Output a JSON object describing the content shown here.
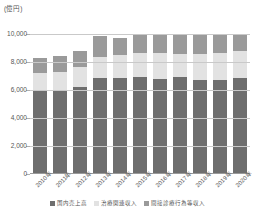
{
  "chart_data": {
    "type": "bar",
    "stacked": true,
    "title": "",
    "subtitle": "",
    "unit_label": "(億円)",
    "xlabel": "",
    "ylabel": "",
    "ylim": [
      0,
      10000
    ],
    "yticks": [
      0,
      2000,
      4000,
      6000,
      8000,
      10000
    ],
    "ytick_labels": [
      "0",
      "2,000",
      "4,000",
      "6,000",
      "8,000",
      "10,000"
    ],
    "grid": true,
    "legend_position": "bottom",
    "categories": [
      "2010年",
      "2011年",
      "2012年",
      "2013年",
      "2014年",
      "2015年",
      "2016年",
      "2017年",
      "2018年",
      "2019年",
      "2020年"
    ],
    "series": [
      {
        "name": "国内売上高",
        "color": "#6e6e6e",
        "values": [
          5970,
          5980,
          6190,
          6830,
          6850,
          6900,
          6900,
          7290,
          6930,
          6860,
          6960
        ]
      },
      {
        "name": "治療関連収入",
        "color": "#e2e2e2",
        "values": [
          1270,
          1320,
          1420,
          1530,
          1630,
          1770,
          1850,
          1700,
          1900,
          2000,
          1940
        ]
      },
      {
        "name": "間接診療行為等収入",
        "color": "#9a9a9a",
        "values": [
          1060,
          1120,
          1190,
          1490,
          1240,
          1320,
          1400,
          1540,
          1480,
          1380,
          1260
        ]
      }
    ],
    "totals": [
      8300,
      8420,
      8800,
      9850,
      9720,
      9990,
      10150,
      10530,
      10310,
      10240,
      10160
    ]
  },
  "legend": {
    "items": [
      {
        "label": "国内売上高",
        "color": "#6e6e6e"
      },
      {
        "label": "治療関連収入",
        "color": "#e2e2e2"
      },
      {
        "label": "間接診療行為等収入",
        "color": "#9a9a9a"
      }
    ]
  }
}
